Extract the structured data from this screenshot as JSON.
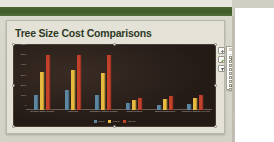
{
  "app": {
    "ribbon_band_color": "#4d6b33",
    "slide_background": "#e4e2d6"
  },
  "slide": {
    "title": "Tree Size Cost Comparisons"
  },
  "chart_tools": {
    "buttons": [
      {
        "name": "chart-elements-button",
        "glyph": "+"
      },
      {
        "name": "chart-styles-button",
        "glyph": "brush"
      },
      {
        "name": "chart-filters-button",
        "glyph": "funnel"
      }
    ]
  },
  "chart_elements_flyout": {
    "title": "CHART ELEMENTS",
    "items": [
      {
        "label": "Axes",
        "checked": true
      },
      {
        "label": "Axis Titles",
        "checked": false
      },
      {
        "label": "Chart Title",
        "checked": false
      },
      {
        "label": "Data Labels",
        "checked": false
      },
      {
        "label": "Data Table",
        "checked": false
      },
      {
        "label": "Error Bars",
        "checked": false
      },
      {
        "label": "Gridlines",
        "checked": false
      },
      {
        "label": "Legend",
        "checked": true
      },
      {
        "label": "Trendline",
        "checked": false
      }
    ]
  },
  "chart_data": {
    "type": "bar",
    "title": "",
    "xlabel": "",
    "ylabel": "",
    "ylim": [
      0,
      6000
    ],
    "yticks": [
      0,
      1000,
      2000,
      3000,
      4000,
      5000,
      6000
    ],
    "grid": false,
    "legend_position": "bottom",
    "categories": [
      "Cleanup Single Regime",
      "Afford Only",
      "Resistance Natural Regime",
      "Restored Short",
      "Stand Management",
      "Protective Strategy Mix Cut"
    ],
    "series": [
      {
        "name": "Year 1",
        "color": "#5b87a3",
        "values": [
          1450,
          2000,
          1500,
          700,
          520,
          620
        ]
      },
      {
        "name": "Year 5",
        "color": "#e8b93f",
        "values": [
          3700,
          3900,
          3600,
          1000,
          1060,
          1180
        ]
      },
      {
        "name": "Year 10",
        "color": "#c3412a",
        "values": [
          5400,
          5400,
          5400,
          1200,
          1400,
          1500
        ]
      }
    ]
  }
}
